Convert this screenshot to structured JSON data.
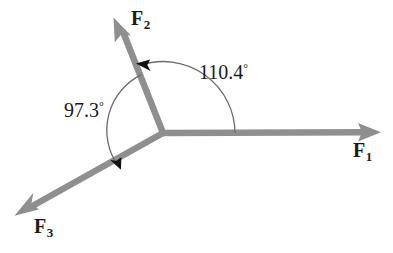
{
  "diagram": {
    "type": "force-vector-diagram",
    "background_color": "#ffffff",
    "vector_color": "#8f8f8f",
    "arc_color": "#6b6b6b",
    "text_color": "#1a1a1a",
    "origin": {
      "x": 163,
      "y": 133
    },
    "vectors": [
      {
        "id": "F1",
        "label_base": "F",
        "label_sub": "1",
        "tip": {
          "x": 380,
          "y": 132
        },
        "angle_deg_from_positive_x": 0
      },
      {
        "id": "F2",
        "label_base": "F",
        "label_sub": "2",
        "tip": {
          "x": 113,
          "y": 18
        },
        "angle_deg_from_positive_x": 110.4
      },
      {
        "id": "F3",
        "label_base": "F",
        "label_sub": "3",
        "tip": {
          "x": 15,
          "y": 215
        },
        "angle_deg_from_positive_x": 207.7
      }
    ],
    "angles": [
      {
        "id": "angle-f1-f2",
        "value": "110.4",
        "degree_symbol": "°",
        "from_vector": "F1",
        "to_vector": "F2",
        "arc_radius": 72,
        "arrow_at": "F2"
      },
      {
        "id": "angle-f2-f3",
        "value": "97.3",
        "degree_symbol": "°",
        "from_vector": "F2",
        "to_vector": "F3",
        "arc_radius": 62,
        "arrow_at": "F3"
      }
    ]
  }
}
